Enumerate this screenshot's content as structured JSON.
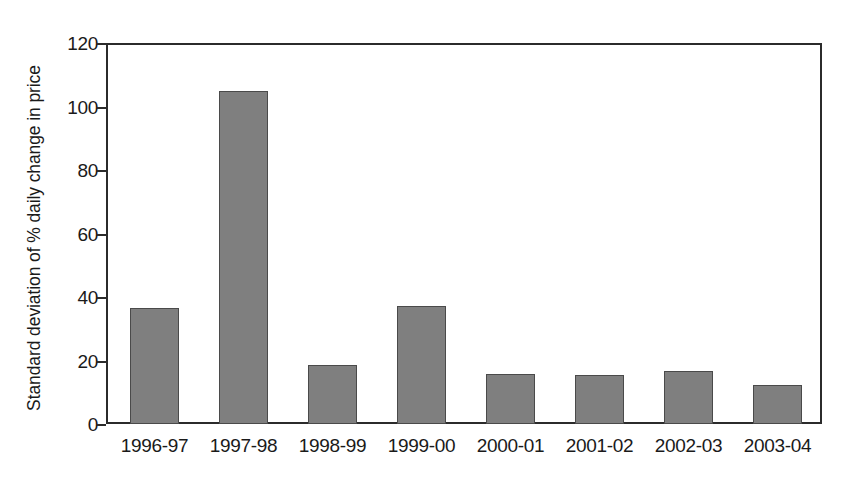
{
  "chart_data": {
    "type": "bar",
    "title": "",
    "subtitle": "",
    "xlabel": "",
    "ylabel": "Standard deviation of % daily change in price",
    "categories": [
      "1996-97",
      "1997-98",
      "1998-99",
      "1999-00",
      "2000-01",
      "2001-02",
      "2002-03",
      "2003-04"
    ],
    "values": [
      36.5,
      104.8,
      18.5,
      37.3,
      15.6,
      15.5,
      16.6,
      12.2
    ],
    "ylim": [
      0,
      120
    ],
    "yticks": [
      0,
      20,
      40,
      60,
      80,
      100,
      120
    ],
    "ytick_labels": [
      "0",
      "20",
      "40",
      "60",
      "80",
      "100",
      "120"
    ],
    "grid": false,
    "legend": null,
    "legend_position": "none",
    "bar_color": "#7f7f7f",
    "bar_edge_color": "#4a4a4a",
    "axis_color": "#2b2b2b",
    "background_color": "#ffffff"
  }
}
